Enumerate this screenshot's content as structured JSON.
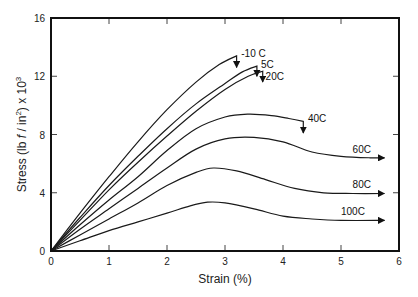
{
  "chart_data": {
    "type": "line",
    "title": "",
    "xlabel": "Strain (%)",
    "ylabel": "Stress (lb f / in²) x 10³",
    "ylabel_parts": {
      "main": "Stress (lb ",
      "f": "f",
      "mid": " / in",
      "sup2": "2",
      "end": ") x 10",
      "sup3": "3"
    },
    "xlim": [
      0,
      6
    ],
    "ylim": [
      0,
      16
    ],
    "xticks": [
      0,
      1,
      2,
      3,
      4,
      5,
      6
    ],
    "yticks": [
      0,
      4,
      8,
      12,
      16
    ],
    "grid": false,
    "legend": "inline labels with arrows at curve ends",
    "series": [
      {
        "name": "-10 C",
        "x": [
          0,
          0.5,
          1.0,
          1.5,
          2.0,
          2.5,
          2.9,
          3.2
        ],
        "y": [
          0,
          2.6,
          5.1,
          7.5,
          9.7,
          11.6,
          12.8,
          13.4
        ],
        "end_arrow": "down",
        "arrow_to": 12.6
      },
      {
        "name": "5C",
        "x": [
          0,
          0.5,
          1.0,
          1.5,
          2.0,
          2.5,
          3.0,
          3.3,
          3.55
        ],
        "y": [
          0,
          2.3,
          4.5,
          6.5,
          8.4,
          10.1,
          11.5,
          12.3,
          12.7
        ],
        "end_arrow": "down",
        "arrow_to": 12.0
      },
      {
        "name": "20C",
        "x": [
          0,
          0.5,
          1.0,
          1.5,
          2.0,
          2.5,
          3.0,
          3.4,
          3.65
        ],
        "y": [
          0,
          2.1,
          4.2,
          6.1,
          7.9,
          9.6,
          11.1,
          12.0,
          12.35
        ],
        "end_arrow": "down",
        "arrow_to": 11.6
      },
      {
        "name": "40C",
        "x": [
          0,
          0.5,
          1.0,
          1.5,
          2.0,
          2.5,
          3.0,
          3.4,
          3.8,
          4.1,
          4.35
        ],
        "y": [
          0,
          1.8,
          3.5,
          5.1,
          6.9,
          8.4,
          9.2,
          9.4,
          9.3,
          9.1,
          8.9
        ],
        "end_arrow": "down",
        "arrow_to": 8.1
      },
      {
        "name": "60C",
        "x": [
          0,
          0.5,
          1.0,
          1.5,
          2.0,
          2.5,
          3.0,
          3.5,
          4.0,
          4.5,
          5.0,
          5.5,
          5.75
        ],
        "y": [
          0,
          1.5,
          2.9,
          4.3,
          5.7,
          7.0,
          7.7,
          7.8,
          7.5,
          6.8,
          6.5,
          6.4,
          6.4
        ],
        "end_arrow": "right"
      },
      {
        "name": "80C",
        "x": [
          0,
          0.5,
          1.0,
          1.5,
          2.0,
          2.5,
          2.8,
          3.2,
          3.7,
          4.2,
          4.7,
          5.2,
          5.75
        ],
        "y": [
          0,
          1.1,
          2.2,
          3.3,
          4.5,
          5.4,
          5.7,
          5.5,
          4.9,
          4.3,
          4.0,
          3.95,
          3.95
        ],
        "end_arrow": "right"
      },
      {
        "name": "100C",
        "x": [
          0,
          0.5,
          1.0,
          1.5,
          2.0,
          2.4,
          2.7,
          3.0,
          3.5,
          4.0,
          4.5,
          5.0,
          5.75
        ],
        "y": [
          0,
          0.7,
          1.4,
          2.0,
          2.6,
          3.1,
          3.35,
          3.3,
          2.9,
          2.4,
          2.2,
          2.1,
          2.1
        ],
        "end_arrow": "right"
      }
    ],
    "label_positions": {
      "-10 C": [
        3.28,
        13.35
      ],
      "5C": [
        3.62,
        12.6
      ],
      "20C": [
        3.7,
        11.75
      ],
      "40C": [
        4.43,
        8.85
      ],
      "60C": [
        5.2,
        6.75
      ],
      "80C": [
        5.2,
        4.3
      ],
      "100C": [
        5.0,
        2.45
      ]
    }
  }
}
